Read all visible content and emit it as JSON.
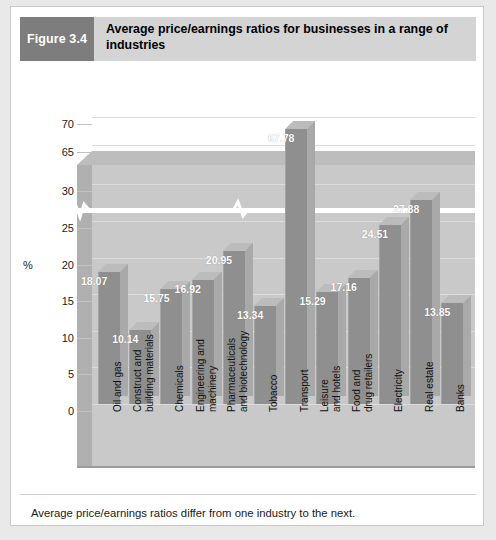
{
  "figure": {
    "number_label": "Figure 3.4",
    "title": "Average price/earnings ratios for businesses in a range of industries",
    "caption": "Average price/earnings ratios differ from one industry to the next."
  },
  "colors": {
    "header_band": "#d4d4d4",
    "figure_box": "#7d7d7d",
    "panel_back": "#c9c9c9",
    "panel_left": "#b0b0b0",
    "panel_top": "#bdbdbd",
    "bar_front": "#8f8f8f",
    "bar_side": "#a9a9a9",
    "bar_top": "#bcbcbc",
    "break_band": "#ffffff",
    "page_background": "#e9e9e9",
    "card_background": "#ffffff"
  },
  "chart_data": {
    "type": "bar",
    "title": "Average price/earnings ratios for businesses in a range of industries",
    "xlabel": "",
    "ylabel": "%",
    "axis_unit_label": "%",
    "grid": true,
    "legend": "none",
    "broken_axis": true,
    "broken_axis_note": "Y axis is broken between 30 and 65",
    "ylim": [
      0,
      70
    ],
    "yticks": [
      0,
      5,
      10,
      15,
      20,
      25,
      30,
      65,
      70
    ],
    "ytick_labels": [
      "0",
      "5",
      "10",
      "15",
      "20",
      "25",
      "30",
      "65",
      "70"
    ],
    "categories": [
      "Oil and gas",
      "Construct and building materials",
      "Chemicals",
      "Engineering and machinery",
      "Pharmaceuticals and biotechnology",
      "Tobacco",
      "Transport",
      "Leisure and hotels",
      "Food and drug retailers",
      "Electricity",
      "Real estate",
      "Banks"
    ],
    "values": [
      18.07,
      10.14,
      15.75,
      16.92,
      20.95,
      13.34,
      67.78,
      15.29,
      17.16,
      24.51,
      27.88,
      13.85
    ],
    "data_labels": [
      "18.07",
      "10.14",
      "15.75",
      "16.92",
      "20.95",
      "13.34",
      "67.78",
      "15.29",
      "17.16",
      "24.51",
      "27.88",
      "13.85"
    ],
    "category_lines": [
      [
        "Oil and gas"
      ],
      [
        "Construct and",
        "building materials"
      ],
      [
        "Chemicals"
      ],
      [
        "Engineering and",
        "machinery"
      ],
      [
        "Pharmaceuticals",
        "and biotechnology"
      ],
      [
        "Tobacco"
      ],
      [
        "Transport"
      ],
      [
        "Leisure",
        "and hotels"
      ],
      [
        "Food and",
        "drug retailers"
      ],
      [
        "Electricity"
      ],
      [
        "Real estate"
      ],
      [
        "Banks"
      ]
    ]
  }
}
